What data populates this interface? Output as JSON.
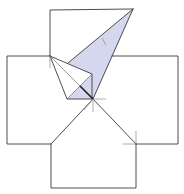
{
  "diagram": {
    "type": "geometric-construction",
    "colors": {
      "stroke": "#3a3a3a",
      "shaded_fill": "#d5d7ef",
      "background": "#ffffff"
    },
    "points": {
      "O": [
        93,
        99
      ],
      "top_square": {
        "tl": [
          50,
          10
        ],
        "tr": [
          133,
          9
        ]
      },
      "left_square": {
        "tl": [
          7,
          56
        ],
        "tr": [
          50,
          56
        ],
        "bl": [
          7,
          144
        ],
        "br": [
          51,
          144
        ]
      },
      "right_square": {
        "tl": [
          112,
          56
        ],
        "tr": [
          178,
          56
        ],
        "bl": [
          136,
          144
        ],
        "br": [
          178,
          144
        ]
      },
      "bottom_square": {
        "tl": [
          51,
          144
        ],
        "tr": [
          136,
          144
        ],
        "bl": [
          51,
          188
        ],
        "br": [
          136,
          188
        ]
      },
      "kite": {
        "apex": [
          50,
          56
        ],
        "right": [
          92,
          74
        ],
        "bottom": [
          67,
          99
        ],
        "center": [
          93,
          99
        ]
      },
      "shaded_triangle": [
        [
          133,
          9
        ],
        [
          68,
          63
        ],
        [
          93,
          99
        ]
      ]
    }
  }
}
